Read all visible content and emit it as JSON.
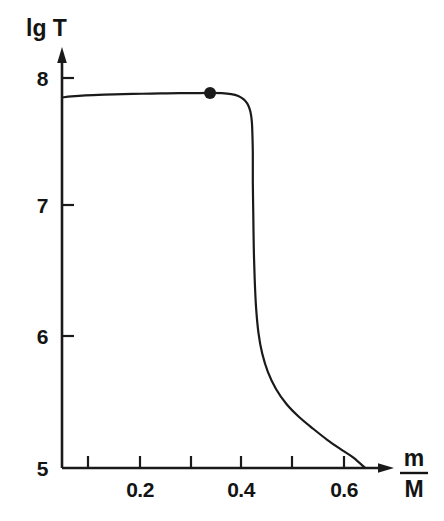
{
  "chart_data": {
    "type": "line",
    "title": "",
    "subtitle": "",
    "xlabel": "m/M",
    "xlabel_numerator": "m",
    "xlabel_denominator": "M",
    "ylabel": "lg T",
    "xlim": [
      0.0,
      0.7
    ],
    "ylim": [
      5.0,
      8.15
    ],
    "grid": false,
    "legend": null,
    "x_ticks": [
      0.0,
      0.1,
      0.2,
      0.3,
      0.4,
      0.5,
      0.6
    ],
    "x_tick_labels": [
      "",
      "",
      "0.2",
      "",
      "0.4",
      "",
      "0.6"
    ],
    "y_ticks": [
      5,
      6,
      7,
      8
    ],
    "y_tick_labels": [
      "5",
      "6",
      "7",
      "8"
    ],
    "axis_arrows": [
      "x-right",
      "y-up"
    ],
    "series": [
      {
        "name": "temperature profile",
        "x": [
          0.0,
          0.02,
          0.05,
          0.09,
          0.13,
          0.17,
          0.21,
          0.25,
          0.28,
          0.315,
          0.34,
          0.36,
          0.375,
          0.386,
          0.394,
          0.399,
          0.402,
          0.404,
          0.405,
          0.406,
          0.406,
          0.407,
          0.408,
          0.41,
          0.413,
          0.418,
          0.426,
          0.438,
          0.455,
          0.478,
          0.505,
          0.535,
          0.565,
          0.595,
          0.62,
          0.645
        ],
        "y": [
          7.85,
          7.858,
          7.866,
          7.872,
          7.876,
          7.879,
          7.881,
          7.883,
          7.884,
          7.885,
          7.883,
          7.876,
          7.862,
          7.838,
          7.805,
          7.765,
          7.72,
          7.66,
          7.58,
          7.42,
          7.2,
          6.95,
          6.7,
          6.45,
          6.23,
          6.04,
          5.88,
          5.74,
          5.61,
          5.49,
          5.39,
          5.3,
          5.215,
          5.14,
          5.08,
          5.0
        ]
      }
    ],
    "markers": [
      {
        "name": "highlight-point",
        "x": 0.315,
        "y": 7.885,
        "style": "filled-circle",
        "color": "#1a1a1a",
        "radius_px": 6
      }
    ],
    "colors": {
      "curve": "#1a1a1a",
      "axis": "#1a1a1a",
      "background": "#ffffff",
      "text": "#141414"
    }
  },
  "labels": {
    "y_axis_label": "lg T",
    "x_axis_numerator": "m",
    "x_axis_denominator": "M",
    "y_tick_8": "8",
    "y_tick_7": "7",
    "y_tick_6": "6",
    "y_tick_5": "5",
    "x_tick_02": "0.2",
    "x_tick_04": "0.4",
    "x_tick_06": "0.6"
  }
}
